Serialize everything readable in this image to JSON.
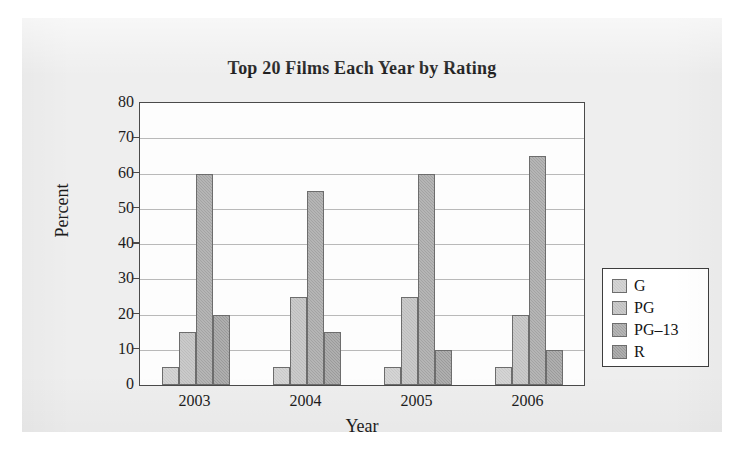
{
  "figure": {
    "background_color": "#eeeeee",
    "page_color": "#ffffff"
  },
  "chart_data": {
    "type": "bar",
    "title": "Top 20 Films Each Year by Rating",
    "xlabel": "Year",
    "ylabel": "Percent",
    "categories": [
      "2003",
      "2004",
      "2005",
      "2006"
    ],
    "ylim": [
      0,
      80
    ],
    "yticks": [
      0,
      10,
      20,
      30,
      40,
      50,
      60,
      70,
      80
    ],
    "ytick_labels": [
      "0",
      "10",
      "20",
      "30",
      "40",
      "50",
      "60",
      "70",
      "80"
    ],
    "grid": true,
    "legend_position": "right-outside",
    "series": [
      {
        "name": "G",
        "color": "#c9c9c9",
        "values": [
          5,
          5,
          5,
          5
        ]
      },
      {
        "name": "PG",
        "color": "#bdbdbd",
        "values": [
          15,
          25,
          25,
          20
        ]
      },
      {
        "name": "PG–13",
        "color": "#a3a3a3",
        "values": [
          60,
          55,
          60,
          65
        ]
      },
      {
        "name": "R",
        "color": "#9a9a9a",
        "values": [
          20,
          15,
          10,
          10
        ]
      }
    ]
  }
}
